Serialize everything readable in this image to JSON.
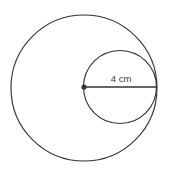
{
  "figure": {
    "background_color": "#ffffff",
    "stroke_color": "#333333",
    "text_color": "#3a3a3a",
    "labels": {
      "diameter": "4 cm"
    },
    "shapes": {
      "large_circle": {
        "name": "large-circle",
        "cx": 84,
        "cy": 88,
        "r": 73
      },
      "small_circle": {
        "name": "small-circle",
        "cx": 120,
        "cy": 87,
        "r": 36.5
      },
      "diameter_segment": {
        "name": "diameter-line",
        "x1": 84,
        "y1": 87,
        "x2": 156.5,
        "y2": 87
      },
      "center_marker": {
        "name": "center-point",
        "cx": 84,
        "cy": 87,
        "r": 2.6
      }
    },
    "label_position": {
      "x": 121,
      "y": 82
    }
  }
}
